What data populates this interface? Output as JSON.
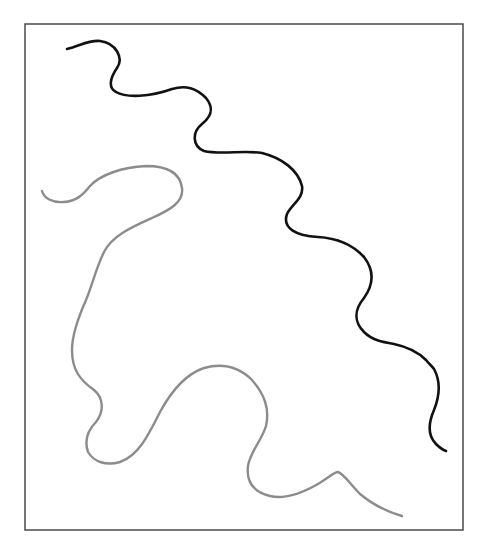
{
  "figure": {
    "width": 487,
    "height": 557,
    "background": "#ffffff",
    "frame": {
      "x": 25,
      "y": 24,
      "width": 438,
      "height": 506,
      "stroke": "#4a4a4a",
      "stroke_width": 1.5
    },
    "curves": [
      {
        "id": "black-curve",
        "color": "#111111",
        "stroke_width": 2.6,
        "path": "M67,49 C80,46 88,40 100,41 C116,43 124,58 117,68 C110,78 108,88 116,92 C126,98 150,97 172,89 C186,85 196,88 206,98 C214,108 212,116 202,124 C192,132 192,146 204,151 C220,155 244,150 262,153 C282,158 298,170 302,186 C304,198 292,204 287,214 C282,228 296,236 318,237 C336,238 352,244 364,257 C374,270 374,284 364,298 C354,310 354,322 364,332 C372,340 382,342 394,344 C408,347 418,352 426,360 C430,365 432,366 434,369 C440,380 440,395 434,410 C428,424 428,436 436,444 C440,448 443,450 446,451"
      },
      {
        "id": "gray-curve",
        "color": "#8c8c8c",
        "stroke_width": 2.4,
        "path": "M42,191 C44,198 52,203 64,202 C76,201 82,196 90,186 C100,175 122,167 146,166 C166,166 180,172 182,188 C184,202 170,210 152,218 C130,228 112,236 104,252 C96,268 92,286 86,300 C78,318 72,336 72,350 C72,370 80,380 94,390 C104,398 104,412 96,422 C88,430 84,440 88,452 C94,462 106,466 120,462 C138,456 148,436 160,412 C172,390 186,374 204,368 C222,363 238,366 252,380 C264,394 270,408 266,426 C262,440 250,452 248,466 C246,482 254,492 270,496 C286,500 304,492 318,484 C328,478 334,472 338,472 C344,474 350,484 360,494 C372,504 388,512 402,516"
      }
    ]
  }
}
